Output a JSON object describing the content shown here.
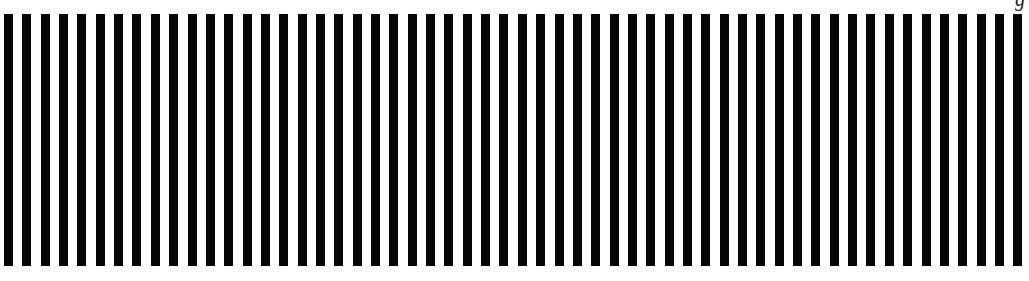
{
  "pattern": {
    "type": "vertical-stripes",
    "bar_count": 56,
    "first_bar_x": 4,
    "period_px": 18.35,
    "bar_width_px": 9,
    "bar_top_px": 14,
    "bar_height_px": 252,
    "bar_color": "#050505",
    "background_color": "#ffffff"
  },
  "corner_text": "g"
}
